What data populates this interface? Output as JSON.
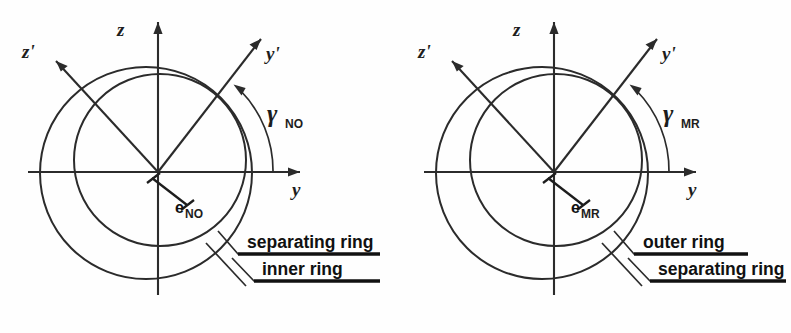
{
  "figure": {
    "background": "#fefefe",
    "ink": "#2b2b2b",
    "panels": [
      {
        "id": "left",
        "axes": {
          "z_label": "z",
          "z_prime_label": "z'",
          "y_label": "y",
          "y_prime_label": "y'"
        },
        "angle": {
          "symbol": "γ",
          "subscript": "NO",
          "value_deg": 45
        },
        "eccentricity": {
          "symbol": "e",
          "subscript": "NO"
        },
        "callouts": [
          {
            "text": "separating ring",
            "target": "outer-circle"
          },
          {
            "text": "inner ring",
            "target": "inner-circle"
          }
        ],
        "rings": [
          {
            "name": "separating ring",
            "cx": 146,
            "cy": 173,
            "r": 106
          },
          {
            "name": "inner ring",
            "cx": 160,
            "cy": 160,
            "r": 86
          }
        ],
        "origin": {
          "x": 158,
          "y": 172
        }
      },
      {
        "id": "right",
        "axes": {
          "z_label": "z",
          "z_prime_label": "z'",
          "y_label": "y",
          "y_prime_label": "y'"
        },
        "angle": {
          "symbol": "γ",
          "subscript": "MR",
          "value_deg": 45
        },
        "eccentricity": {
          "symbol": "e",
          "subscript": "MR"
        },
        "callouts": [
          {
            "text": "outer ring",
            "target": "outer-circle"
          },
          {
            "text": "separating ring",
            "target": "inner-circle"
          }
        ],
        "rings": [
          {
            "name": "outer ring",
            "cx": 146,
            "cy": 173,
            "r": 106
          },
          {
            "name": "separating ring",
            "cx": 160,
            "cy": 160,
            "r": 86
          }
        ],
        "origin": {
          "x": 158,
          "y": 172
        }
      }
    ]
  }
}
